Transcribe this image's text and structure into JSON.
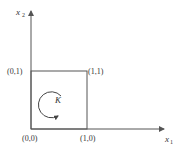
{
  "diagram": {
    "axes": {
      "x_label": "x",
      "x_subscript": "1",
      "y_label": "x",
      "y_subscript": "2"
    },
    "corners": {
      "origin": "(0,0)",
      "bottom_right": "(1,0)",
      "top_left": "(0,1)",
      "top_right": "(1,1)"
    },
    "region_label": "K",
    "colors": {
      "stroke": "#555555",
      "text": "#333333"
    }
  }
}
